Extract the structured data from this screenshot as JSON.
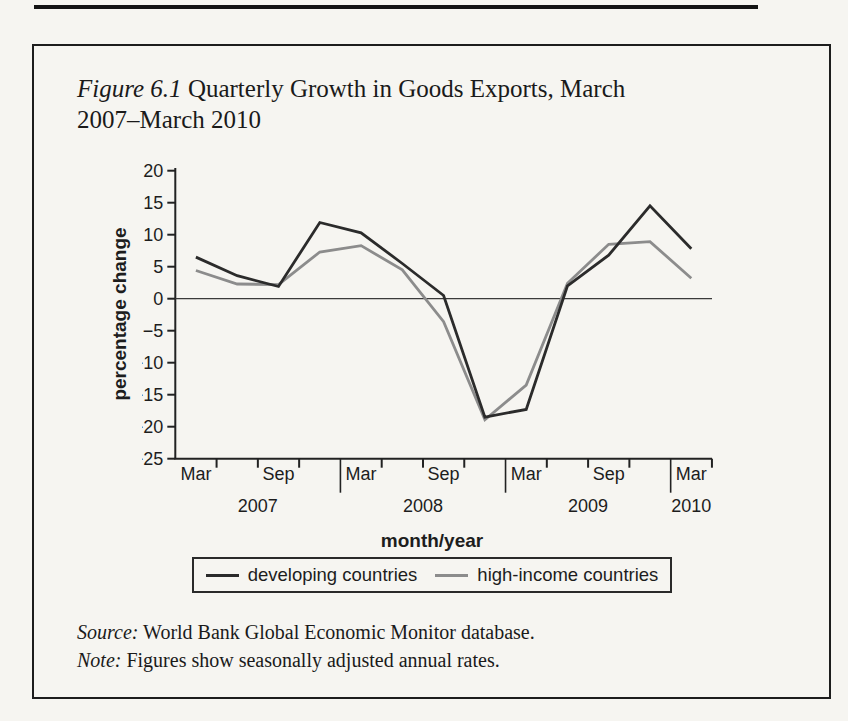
{
  "figure": {
    "label": "Figure 6.1",
    "title": "Quarterly Growth in Goods Exports, March 2007–March 2010",
    "source_label": "Source:",
    "source_text": "World Bank Global Economic Monitor database.",
    "note_label": "Note:",
    "note_text": "Figures show seasonally adjusted annual rates."
  },
  "chart_data": {
    "type": "line",
    "title": "Figure 6.1 Quarterly Growth in Goods Exports, March 2007–March 2010",
    "xlabel": "month/year",
    "ylabel": "percentage change",
    "ylim": [
      -25,
      20
    ],
    "yticks": [
      20,
      15,
      10,
      5,
      0,
      -5,
      -10,
      -15,
      -20,
      -25
    ],
    "x": [
      "Mar 2007",
      "Jun 2007",
      "Sep 2007",
      "Dec 2007",
      "Mar 2008",
      "Jun 2008",
      "Sep 2008",
      "Dec 2008",
      "Mar 2009",
      "Jun 2009",
      "Sep 2009",
      "Dec 2009",
      "Mar 2010"
    ],
    "series": [
      {
        "name": "developing countries",
        "color": "#2b2b2b",
        "values": [
          6.5,
          3.6,
          1.9,
          11.9,
          10.3,
          5.5,
          0.5,
          -18.5,
          -17.3,
          2.0,
          6.8,
          14.5,
          7.8
        ]
      },
      {
        "name": "high-income countries",
        "color": "#8c8c8c",
        "values": [
          4.4,
          2.3,
          2.2,
          7.3,
          8.3,
          4.5,
          -3.6,
          -18.9,
          -13.5,
          2.4,
          8.5,
          8.9,
          3.2
        ]
      }
    ],
    "x_tick_labels_shown": [
      "Mar",
      "Sep",
      "Mar",
      "Sep",
      "Mar",
      "Sep",
      "Mar"
    ],
    "year_labels": [
      "2007",
      "2008",
      "2009",
      "2010"
    ],
    "zero_line": true,
    "grid": false,
    "legend_position": "bottom"
  }
}
